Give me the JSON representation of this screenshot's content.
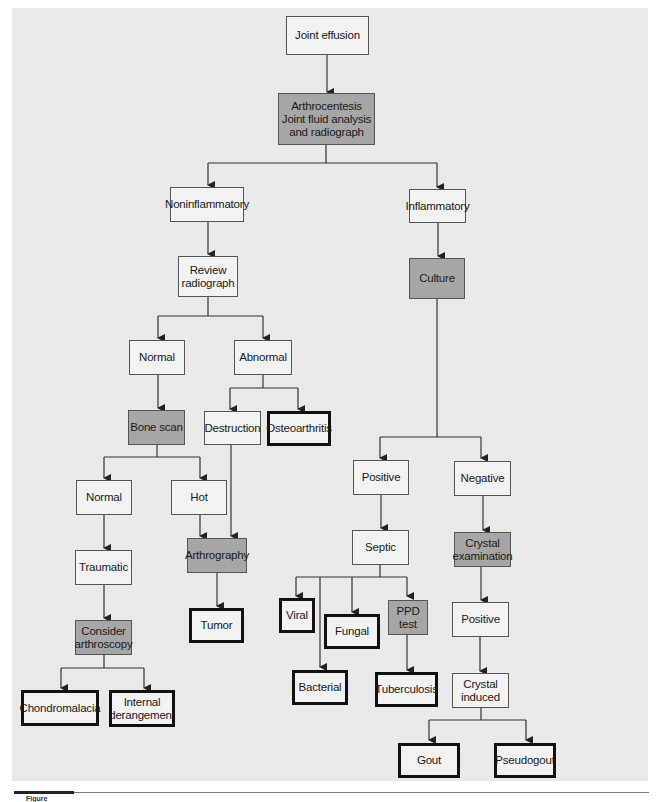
{
  "diagram": {
    "colors": {
      "background_panel": "#e9e9e9",
      "node_fill": "#f2f2f2",
      "shaded_fill": "#a6a6a6",
      "line": "#333333"
    },
    "nodes": {
      "joint_effusion": "Joint effusion",
      "arthrocentesis": "Arthrocentesis\nJoint fluid analysis\nand radiograph",
      "noninflammatory": "Noninflammatory",
      "inflammatory": "Inflammatory",
      "review_radiograph": "Review\nradiograph",
      "culture": "Culture",
      "normal_1": "Normal",
      "abnormal": "Abnormal",
      "bone_scan": "Bone scan",
      "destruction": "Destruction",
      "osteoarthritis": "Osteoarthritis",
      "normal_2": "Normal",
      "hot": "Hot",
      "traumatic": "Traumatic",
      "arthrography": "Arthrography",
      "consider_arthroscopy": "Consider\narthroscopy",
      "tumor": "Tumor",
      "chondromalacia": "Chondromalacia",
      "internal_derangement": "Internal\nderangement",
      "positive_1": "Positive",
      "negative": "Negative",
      "septic": "Septic",
      "crystal_examination": "Crystal\nexamination",
      "viral": "Viral",
      "fungal": "Fungal",
      "ppd_test": "PPD\ntest",
      "bacterial": "Bacterial",
      "tuberculosis": "Tuberculosis",
      "positive_2": "Positive",
      "crystal_induced": "Crystal\ninduced",
      "gout": "Gout",
      "pseudogout": "Pseudogout"
    },
    "edges": [
      [
        "joint_effusion",
        "arthrocentesis"
      ],
      [
        "arthrocentesis",
        "noninflammatory"
      ],
      [
        "arthrocentesis",
        "inflammatory"
      ],
      [
        "noninflammatory",
        "review_radiograph"
      ],
      [
        "review_radiograph",
        "normal_1"
      ],
      [
        "review_radiograph",
        "abnormal"
      ],
      [
        "normal_1",
        "bone_scan"
      ],
      [
        "abnormal",
        "destruction"
      ],
      [
        "abnormal",
        "osteoarthritis"
      ],
      [
        "bone_scan",
        "normal_2"
      ],
      [
        "bone_scan",
        "hot"
      ],
      [
        "normal_2",
        "traumatic"
      ],
      [
        "hot",
        "arthrography"
      ],
      [
        "destruction",
        "arthrography"
      ],
      [
        "traumatic",
        "consider_arthroscopy"
      ],
      [
        "arthrography",
        "tumor"
      ],
      [
        "consider_arthroscopy",
        "chondromalacia"
      ],
      [
        "consider_arthroscopy",
        "internal_derangement"
      ],
      [
        "inflammatory",
        "culture"
      ],
      [
        "culture",
        "positive_1"
      ],
      [
        "culture",
        "negative"
      ],
      [
        "positive_1",
        "septic"
      ],
      [
        "septic",
        "viral"
      ],
      [
        "septic",
        "bacterial"
      ],
      [
        "septic",
        "fungal"
      ],
      [
        "septic",
        "ppd_test"
      ],
      [
        "ppd_test",
        "tuberculosis"
      ],
      [
        "negative",
        "crystal_examination"
      ],
      [
        "crystal_examination",
        "positive_2"
      ],
      [
        "positive_2",
        "crystal_induced"
      ],
      [
        "crystal_induced",
        "gout"
      ],
      [
        "crystal_induced",
        "pseudogout"
      ]
    ],
    "caption": "Figure"
  }
}
